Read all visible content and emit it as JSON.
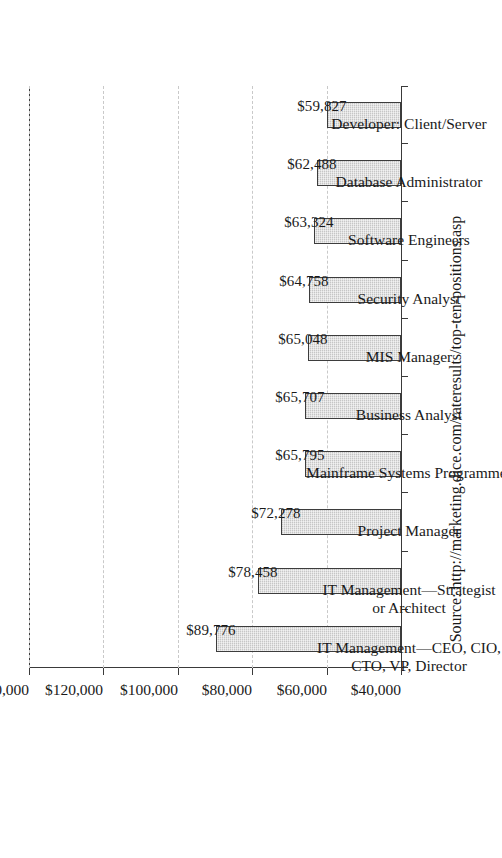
{
  "chart_data": {
    "type": "bar",
    "title": "",
    "xlabel": "",
    "ylabel": "",
    "orientation": "vertical-bars-printed-sideways",
    "grid": true,
    "legend": null,
    "ylim": [
      40000,
      140000
    ],
    "ytick_interval": 20000,
    "categories": [
      "IT Management—CEO, CIO, CTO, VP, Director",
      "IT Management—Strategist or Architect",
      "Project Manager",
      "Mainframe Systems Programmer",
      "Business Analyst",
      "MIS  Manager",
      "Security  Analyst",
      "Software Engineers",
      "Database Administrator",
      "Developer: Client/Server"
    ],
    "category_lines": [
      [
        "IT Management—CEO, CIO,",
        "CTO, VP, Director"
      ],
      [
        "IT Management—Strategist",
        "or Architect"
      ],
      [
        "Project Manager"
      ],
      [
        "Mainframe Systems Programmer"
      ],
      [
        "Business Analyst"
      ],
      [
        "MIS  Manager"
      ],
      [
        "Security  Analyst"
      ],
      [
        "Software Engineers"
      ],
      [
        "Database Administrator"
      ],
      [
        "Developer: Client/Server"
      ]
    ],
    "values": [
      89776,
      78458,
      72278,
      65795,
      65707,
      65048,
      64758,
      63324,
      62488,
      59827
    ],
    "value_labels": [
      "$89,776",
      "$78,458",
      "$72,278",
      "$65,795",
      "$65,707",
      "$65,048",
      "$64,758",
      "$63,324",
      "$62,488",
      "$59,827"
    ],
    "ytick_labels": [
      "$40,000",
      "$60,000",
      "$80,000",
      "$100,000",
      "$120,000",
      "$140,000"
    ],
    "ytick_values": [
      40000,
      60000,
      80000,
      100000,
      120000,
      140000
    ],
    "colors": {
      "bar_fill": "#c6c6c6",
      "bar_border": "#3d3d3d",
      "axis": "#3a3a3a",
      "gridline": "#c9c9c9",
      "text": "#1a1a1a",
      "background": "#ffffff"
    }
  },
  "caption": {
    "source_note": "Source: http://marketing.dice.com/rateresults/top-ten-positions.asp"
  }
}
